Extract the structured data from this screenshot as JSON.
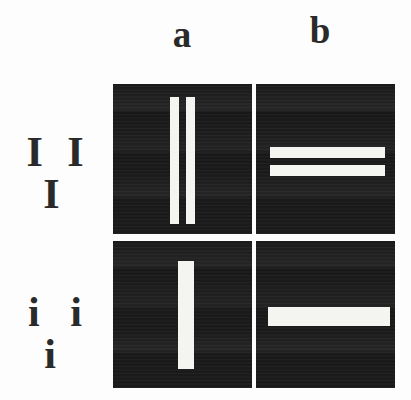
{
  "figure": {
    "background_color": "#fdfdfd",
    "panel_color": "#1b1b1b",
    "bar_color": "#f4f4f0",
    "label_color": "#2a2a2a",
    "column_labels": [
      {
        "id": "a",
        "text": "a"
      },
      {
        "id": "b",
        "text": "b"
      }
    ],
    "row_labels": [
      {
        "id": "III",
        "text": "I I I"
      },
      {
        "id": "iii",
        "text": "i i i"
      }
    ],
    "panels": [
      {
        "id": "IIIa",
        "row": "III",
        "column": "a",
        "orientation": "vertical",
        "bar_count": 2,
        "bar_thickness": "thin"
      },
      {
        "id": "IIIb",
        "row": "III",
        "column": "b",
        "orientation": "horizontal",
        "bar_count": 2,
        "bar_thickness": "thin"
      },
      {
        "id": "iiia",
        "row": "iii",
        "column": "a",
        "orientation": "vertical",
        "bar_count": 1,
        "bar_thickness": "thick"
      },
      {
        "id": "iiib",
        "row": "iii",
        "column": "b",
        "orientation": "horizontal",
        "bar_count": 1,
        "bar_thickness": "thick"
      }
    ]
  }
}
